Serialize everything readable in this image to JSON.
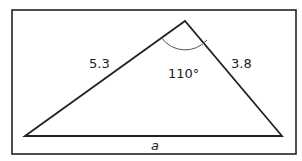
{
  "diagram": {
    "type": "triangle",
    "sides": {
      "left": "5.3",
      "right": "3.8",
      "base": "a"
    },
    "angle": {
      "label": "110°",
      "vertex": "apex"
    },
    "colors": {
      "stroke": "#222222",
      "arc": "#555555",
      "background": "#ffffff"
    }
  }
}
